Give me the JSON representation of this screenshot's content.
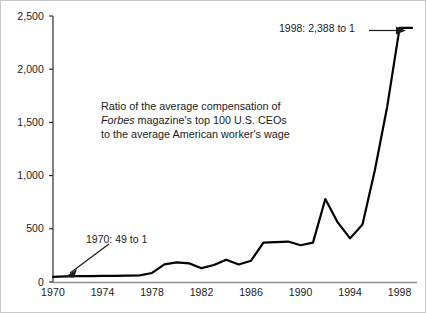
{
  "figure": {
    "background_color": "#ffffff",
    "line_color": "#000000",
    "text_color": "#1a1a1a"
  },
  "caption": {
    "line1": "Ratio of the average compensation of",
    "line2_italic": "Forbes",
    "line2_rest": " magazine's top 100 U.S. CEOs",
    "line3": "to the average American worker's wage"
  },
  "annotations": [
    {
      "id": "start",
      "label": "1970:  49 to 1",
      "arrow": "down-left-arrow"
    },
    {
      "id": "end",
      "label": "1998: 2,388 to 1",
      "arrow": "right-arrow"
    }
  ],
  "chart_data": {
    "type": "line",
    "title": "",
    "subtitle": "",
    "xlabel": "",
    "ylabel": "",
    "xlim": [
      1970,
      1999
    ],
    "ylim": [
      0,
      2500
    ],
    "grid": false,
    "legend": "none",
    "x_tick_labels": [
      "1970",
      "1974",
      "1978",
      "1982",
      "1986",
      "1990",
      "1994",
      "1998"
    ],
    "x_tick_values": [
      1970,
      1974,
      1978,
      1982,
      1986,
      1990,
      1994,
      1998
    ],
    "y_tick_labels": [
      "0",
      "500",
      "1,000",
      "1,500",
      "2,000",
      "2,500"
    ],
    "y_tick_values": [
      0,
      500,
      1000,
      1500,
      2000,
      2500
    ],
    "series": [
      {
        "name": "CEO pay to average worker wage ratio",
        "x": [
          1970,
          1971,
          1972,
          1973,
          1974,
          1975,
          1976,
          1977,
          1978,
          1979,
          1980,
          1981,
          1982,
          1983,
          1984,
          1985,
          1986,
          1987,
          1988,
          1989,
          1990,
          1991,
          1992,
          1993,
          1994,
          1995,
          1996,
          1997,
          1998,
          1999
        ],
        "values": [
          49,
          52,
          55,
          56,
          57,
          58,
          60,
          63,
          85,
          165,
          185,
          175,
          130,
          160,
          210,
          165,
          200,
          370,
          375,
          380,
          345,
          370,
          780,
          560,
          410,
          540,
          1050,
          1650,
          2388,
          2388
        ]
      }
    ],
    "annotated_points": [
      {
        "x": 1970,
        "y": 49,
        "text": "1970:  49 to 1"
      },
      {
        "x": 1998,
        "y": 2388,
        "text": "1998: 2,388 to 1"
      }
    ]
  }
}
